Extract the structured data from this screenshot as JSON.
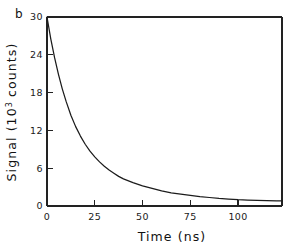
{
  "figure": {
    "panel_label": "b",
    "background_color": "#ffffff",
    "axis_color": "#222222",
    "curve_color": "#1b1b1b"
  },
  "chart_data": {
    "type": "line",
    "title": "",
    "subtitle": "",
    "panel": "b",
    "xlabel": "Time (ns)",
    "ylabel": "Signal (10",
    "ylabel_exponent": "3",
    "ylabel_tail": " counts)",
    "ylabel_full": "Signal (10^3 counts)",
    "xlim": [
      0,
      123
    ],
    "ylim": [
      0,
      30
    ],
    "xticks": [
      0,
      25,
      50,
      75,
      100
    ],
    "xticklabels": [
      "0",
      "25",
      "50",
      "75",
      "100"
    ],
    "yticks": [
      0,
      6,
      12,
      18,
      24,
      30
    ],
    "yticklabels": [
      "0",
      "6",
      "12",
      "18",
      "24",
      "30"
    ],
    "grid": false,
    "legend": null,
    "series": [
      {
        "name": "fluorescence decay",
        "model": "single exponential decay with small constant offset",
        "x": [
          0,
          2,
          4,
          6,
          8,
          10,
          12.5,
          15,
          17.5,
          20,
          22.5,
          25,
          27.5,
          30,
          32.5,
          35,
          37.5,
          40,
          45,
          50,
          55,
          60,
          65,
          70,
          75,
          80,
          85,
          90,
          95,
          100,
          105,
          110,
          115,
          120,
          123
        ],
        "y": [
          30.0,
          26.5,
          23.5,
          20.9,
          18.6,
          16.6,
          14.4,
          12.6,
          11.1,
          9.8,
          8.7,
          7.8,
          7.0,
          6.3,
          5.7,
          5.2,
          4.7,
          4.3,
          3.7,
          3.2,
          2.8,
          2.4,
          2.1,
          1.9,
          1.7,
          1.5,
          1.35,
          1.2,
          1.1,
          1.0,
          0.95,
          0.9,
          0.85,
          0.8,
          0.8
        ]
      }
    ]
  }
}
